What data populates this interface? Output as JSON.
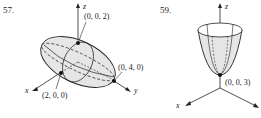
{
  "figures": [
    {
      "number": "57.",
      "shape": "ellipsoid",
      "axes": {
        "x": "x",
        "y": "y",
        "z": "z"
      },
      "points": [
        {
          "label": "(0, 0, 2)"
        },
        {
          "label": "(0, 4, 0)"
        },
        {
          "label": "(2, 0, 0)"
        }
      ]
    },
    {
      "number": "59.",
      "shape": "paraboloid",
      "axes": {
        "x": "x",
        "y": "y",
        "z": "z"
      },
      "points": [
        {
          "label": "(0, 0, 3)"
        }
      ]
    }
  ],
  "colors": {
    "fill": "#e6e6e6",
    "stroke": "#222222"
  }
}
